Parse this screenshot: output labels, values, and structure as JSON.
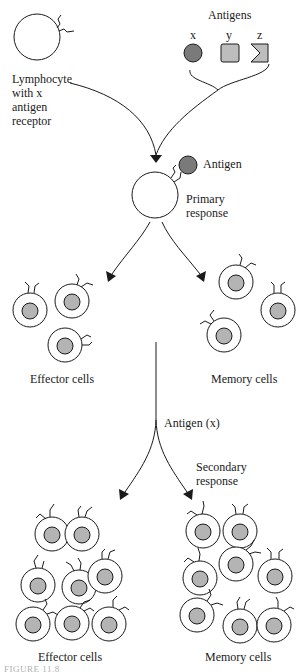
{
  "colors": {
    "antigen_x": "#7a7a7a",
    "antigen_y": "#bdbdbd",
    "antigen_z": "#bdbdbd",
    "nucleus": "#b4b4b4",
    "stroke": "#1a1a1a"
  },
  "labels": {
    "antigens_title": "Antigens",
    "antigen_x": "x",
    "antigen_y": "y",
    "antigen_z": "z",
    "lymphocyte": "Lymphocyte with x antigen receptor",
    "bound_antigen": "Antigen",
    "primary_response": "Primary response",
    "effector_cells_1": "Effector cells",
    "memory_cells_1": "Memory cells",
    "antigen_x_challenge": "Antigen (x)",
    "secondary_response": "Secondary response",
    "effector_cells_2": "Effector cells",
    "memory_cells_2": "Memory cells",
    "figure_caption": "FIGURE 11.8"
  },
  "diagram": {
    "nodes": [
      {
        "id": "lymphocyte",
        "label": "Lymphocyte with x antigen receptor"
      },
      {
        "id": "antigens",
        "label": "Antigens",
        "items": [
          "x",
          "y",
          "z"
        ]
      },
      {
        "id": "primary",
        "label": "Primary response"
      },
      {
        "id": "effector1",
        "label": "Effector cells",
        "count": 3
      },
      {
        "id": "memory1",
        "label": "Memory cells",
        "count": 3
      },
      {
        "id": "challenge",
        "label": "Antigen (x)"
      },
      {
        "id": "effector2",
        "label": "Effector cells",
        "count": 8
      },
      {
        "id": "memory2",
        "label": "Memory cells",
        "count": 8
      }
    ],
    "edges": [
      {
        "from": "lymphocyte",
        "to": "primary"
      },
      {
        "from": "antigens",
        "to": "primary"
      },
      {
        "from": "primary",
        "to": "effector1"
      },
      {
        "from": "primary",
        "to": "memory1"
      },
      {
        "from": "memory1",
        "to": "effector2",
        "via": "challenge"
      },
      {
        "from": "memory1",
        "to": "memory2",
        "via": "challenge"
      }
    ]
  }
}
